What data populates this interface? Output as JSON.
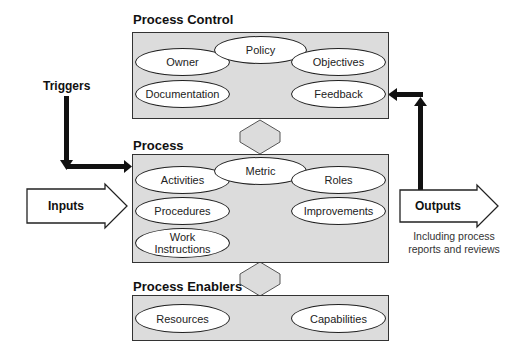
{
  "diagram": {
    "process_control": {
      "title": "Process Control",
      "items": [
        "Policy",
        "Owner",
        "Objectives",
        "Documentation",
        "Feedback"
      ]
    },
    "process": {
      "title": "Process",
      "items": [
        "Metric",
        "Activities",
        "Roles",
        "Procedures",
        "Improvements",
        "Work Instructions"
      ],
      "work_line1": "Work",
      "work_line2": "Instructions"
    },
    "process_enablers": {
      "title": "Process Enablers",
      "items": [
        "Resources",
        "Capabilities"
      ]
    },
    "triggers": {
      "label": "Triggers"
    },
    "inputs": {
      "label": "Inputs"
    },
    "outputs": {
      "label": "Outputs",
      "note_line1": "Including process",
      "note_line2": "reports and reviews"
    },
    "colors": {
      "box_fill": "#dcdcdc",
      "ellipse_fill": "#ffffff",
      "stroke": "#111111"
    }
  }
}
